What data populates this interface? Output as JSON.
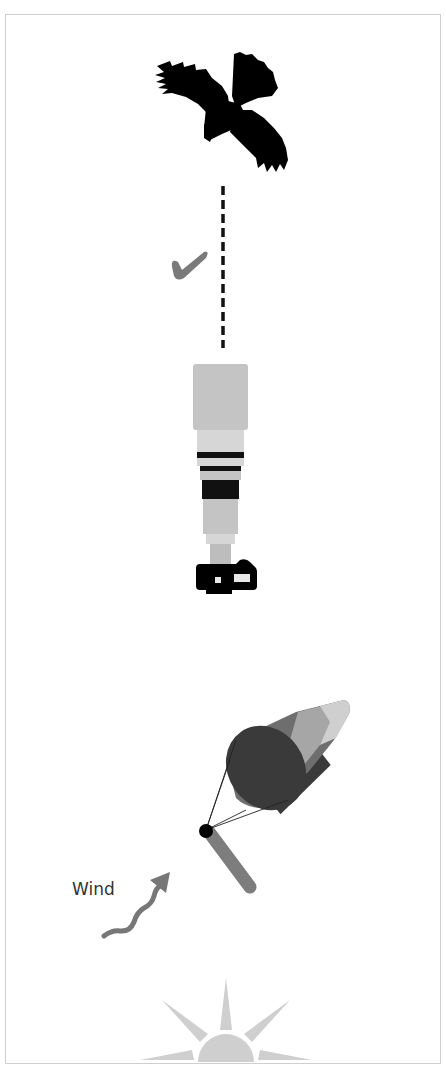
{
  "diagram": {
    "labels": {
      "wind": "Wind"
    },
    "elements": [
      {
        "name": "bird-silhouette",
        "description": "Flying bird of prey seen from below"
      },
      {
        "name": "line-of-sight",
        "style": "dashed",
        "color": "#111111"
      },
      {
        "name": "checkmark",
        "color": "#7a7a7a"
      },
      {
        "name": "telephoto-lens-camera",
        "orientation": "pointing up"
      },
      {
        "name": "windsock",
        "stripes": [
          "#3a3a3a",
          "#6e6e6e",
          "#a6a6a6",
          "#6e6e6e",
          "#c8c8c8"
        ]
      },
      {
        "name": "wind-arrow",
        "color": "#777777"
      },
      {
        "name": "sun",
        "color": "#cfcfcf"
      }
    ],
    "colors": {
      "frame": "#cfcfcf",
      "lens_light": "#c4c4c4",
      "lens_lighter": "#d6d6d6",
      "band": "#111111",
      "pole": "#7d7d7d"
    }
  }
}
